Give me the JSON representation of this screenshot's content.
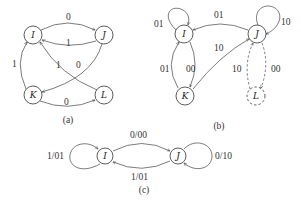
{
  "figures": {
    "a": {
      "caption": "(a)",
      "nodes": {
        "I": "I",
        "J": "J",
        "K": "K",
        "L": "L"
      },
      "edges": {
        "I_J": "0",
        "J_I": "1",
        "K_I": "1",
        "L_I": "1",
        "J_K": "0",
        "K_L": "0"
      }
    },
    "b": {
      "caption": "(b)",
      "nodes": {
        "I": "I",
        "J": "J",
        "K": "K",
        "L": "L"
      },
      "edges": {
        "I_I": "01",
        "J_I": "01",
        "J_J": "10",
        "K_I": "01",
        "I_K": "00",
        "K_J": "10",
        "L_J": "10",
        "J_L": "00"
      }
    },
    "c": {
      "caption": "(c)",
      "nodes": {
        "I": "I",
        "J": "J"
      },
      "edges": {
        "I_I": "1/01",
        "I_J": "0/00",
        "J_I": "1/01",
        "J_J": "0/10"
      }
    }
  }
}
